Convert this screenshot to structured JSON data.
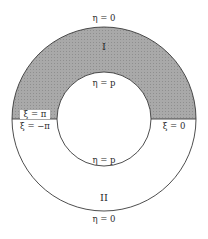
{
  "diagram": {
    "type": "annulus-region-diagram",
    "colors": {
      "shaded_region": "#a9a9a9",
      "line": "#3a3a3a",
      "background": "#ffffff",
      "label_box": "#ffffff"
    },
    "regions": [
      {
        "id": "I",
        "label": "I",
        "shaded": true,
        "position": "upper half of annulus"
      },
      {
        "id": "II",
        "label": "II",
        "shaded": false,
        "position": "lower half of annulus"
      }
    ],
    "labels": {
      "outer_top": "η = 0",
      "outer_bottom": "η = 0",
      "inner_top": "η = p",
      "inner_bottom": "η = p",
      "cut_left_upper": "ξ = π",
      "cut_left_lower": "ξ = −π",
      "cut_right": "ξ = 0",
      "region_upper": "I",
      "region_lower": "II"
    }
  }
}
